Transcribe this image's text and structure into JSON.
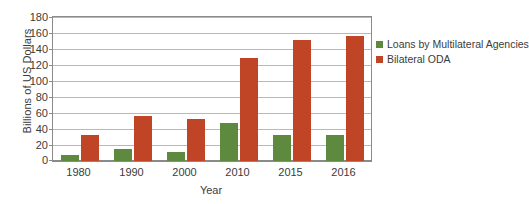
{
  "chart_data": {
    "type": "bar",
    "title": "",
    "subtitle": "",
    "xlabel": "Year",
    "ylabel": "Billions of US Dollars",
    "categories": [
      "1980",
      "1990",
      "2000",
      "2010",
      "2015",
      "2016"
    ],
    "series": [
      {
        "name": "Loans by Multilateral Agencies",
        "color": "#5d8a3f",
        "values": [
          7,
          15,
          11,
          48,
          33,
          32
        ]
      },
      {
        "name": "Bilateral ODA",
        "color": "#bf4526",
        "values": [
          32,
          56,
          52,
          129,
          151,
          156
        ]
      }
    ],
    "ylim": [
      0,
      180
    ],
    "ytick_step": 20,
    "yticks": [
      0,
      20,
      40,
      60,
      80,
      100,
      120,
      140,
      160,
      180
    ],
    "ytick_labels": [
      "0",
      "20",
      "40",
      "60",
      "80",
      "100",
      "120",
      "140",
      "160",
      "180"
    ],
    "grid": true,
    "grid_axis": "y",
    "legend_position": "right",
    "plot_border": true,
    "background_color": "#ffffff",
    "axis_color": "#8a8a8a",
    "gridline_color": "#b9b9b9",
    "text_color": "#3b3b3b"
  }
}
